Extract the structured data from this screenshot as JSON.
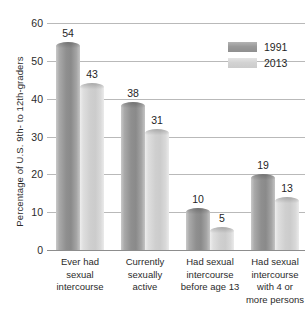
{
  "chart_data": {
    "type": "bar",
    "title": "",
    "xlabel": "",
    "ylabel": "Percentage of U.S. 9th- to 12th-graders",
    "ylim": [
      0,
      60
    ],
    "yticks": [
      0,
      10,
      20,
      30,
      40,
      50,
      60
    ],
    "grid": true,
    "legend_position": "top-right",
    "categories": [
      "Ever had sexual intercourse",
      "Currently sexually active",
      "Had sexual intercourse before age 13",
      "Had sexual intercourse with 4 or more persons"
    ],
    "category_lines": [
      [
        "Ever had",
        "sexual",
        "intercourse"
      ],
      [
        "Currently",
        "sexually",
        "active"
      ],
      [
        "Had sexual",
        "intercourse",
        "before age 13"
      ],
      [
        "Had sexual",
        "intercourse",
        "with 4 or",
        "more persons"
      ]
    ],
    "series": [
      {
        "name": "1991",
        "color": "#8f8f8f",
        "values": [
          54,
          38,
          10,
          19
        ]
      },
      {
        "name": "2013",
        "color": "#cfcfcf",
        "values": [
          43,
          31,
          5,
          13
        ]
      }
    ]
  }
}
